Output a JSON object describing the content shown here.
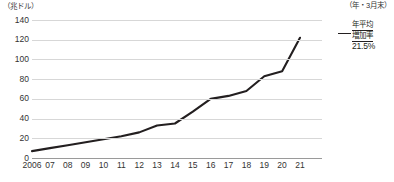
{
  "chart_data": {
    "type": "line",
    "title": "",
    "subtitle": "",
    "xlabel": "",
    "ylabel": "",
    "unit_label": "（兆ドル）",
    "x_axis_caption": "（年・3月末）",
    "categories": [
      "2006",
      "07",
      "08",
      "09",
      "10",
      "11",
      "12",
      "13",
      "14",
      "15",
      "16",
      "17",
      "18",
      "19",
      "20",
      "21"
    ],
    "values": [
      7,
      10,
      13,
      16,
      19,
      22,
      26,
      33,
      35,
      47,
      60,
      63,
      68,
      83,
      88,
      122
    ],
    "series": [
      {
        "name": "残高",
        "values": [
          7,
          10,
          13,
          16,
          19,
          22,
          26,
          33,
          35,
          47,
          60,
          63,
          68,
          83,
          88,
          122
        ]
      }
    ],
    "ylim": [
      0,
      140
    ],
    "yticks": [
      0,
      20,
      40,
      60,
      80,
      100,
      120,
      140
    ],
    "ytick_labels": [
      "0",
      "20",
      "40",
      "60",
      "80",
      "100",
      "120",
      "140"
    ],
    "grid": true,
    "legend": false,
    "line_color": "#231f20",
    "grid_color": "#d7d7d7",
    "axis_color": "#9a9a9a"
  },
  "annotation": {
    "line1": "年平均",
    "line2": "増加率",
    "value": "21.5%"
  },
  "source_note": ""
}
